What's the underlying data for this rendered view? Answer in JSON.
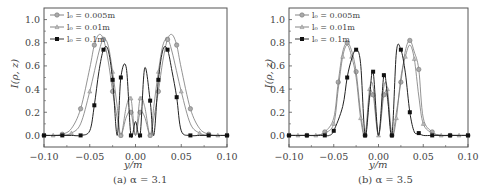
{
  "chart_data": [
    {
      "type": "line",
      "panel": "a",
      "title": "",
      "caption": "(a) α = 3.1",
      "xlabel": "y/m",
      "ylabel": "I(ρ, z)",
      "xlim": [
        -0.1,
        0.1
      ],
      "ylim": [
        -0.1,
        1.1
      ],
      "xticks": [
        "−0.10",
        "−0.05",
        "0.00",
        "0.05",
        "0.10"
      ],
      "yticks": [
        "0.0",
        "0.2",
        "0.4",
        "0.6",
        "0.8",
        "1.0"
      ],
      "grid": false,
      "legend_position": "upper left",
      "series": [
        {
          "name": "l0 = 0.005m",
          "marker": "circle",
          "color": "#888888",
          "x": [
            -0.1,
            -0.09,
            -0.08,
            -0.07,
            -0.06,
            -0.05,
            -0.045,
            -0.04,
            -0.035,
            -0.03,
            -0.025,
            -0.02,
            -0.016,
            -0.01,
            -0.005,
            0.0,
            0.005,
            0.01,
            0.016,
            0.02,
            0.025,
            0.03,
            0.035,
            0.04,
            0.045,
            0.05,
            0.06,
            0.07,
            0.08,
            0.09,
            0.1
          ],
          "values": [
            0.0,
            0.0,
            0.01,
            0.06,
            0.23,
            0.58,
            0.78,
            0.87,
            0.83,
            0.65,
            0.38,
            0.15,
            0.0,
            0.16,
            0.2,
            0.0,
            0.2,
            0.16,
            0.0,
            0.15,
            0.38,
            0.65,
            0.83,
            0.87,
            0.78,
            0.58,
            0.23,
            0.06,
            0.01,
            0.0,
            0.0
          ]
        },
        {
          "name": "l0 = 0.01m",
          "marker": "triangle",
          "color": "#999999",
          "x": [
            -0.1,
            -0.09,
            -0.08,
            -0.07,
            -0.06,
            -0.05,
            -0.04,
            -0.035,
            -0.03,
            -0.025,
            -0.02,
            -0.016,
            -0.01,
            -0.005,
            0.0,
            0.005,
            0.01,
            0.016,
            0.02,
            0.025,
            0.03,
            0.035,
            0.04,
            0.05,
            0.06,
            0.07,
            0.08,
            0.09,
            0.1
          ],
          "values": [
            0.0,
            0.0,
            0.0,
            0.02,
            0.1,
            0.38,
            0.72,
            0.83,
            0.78,
            0.55,
            0.25,
            0.0,
            0.25,
            0.32,
            0.0,
            0.32,
            0.25,
            0.0,
            0.25,
            0.55,
            0.78,
            0.83,
            0.72,
            0.38,
            0.1,
            0.02,
            0.0,
            0.0,
            0.0
          ]
        },
        {
          "name": "l0 = 0.1m",
          "marker": "square",
          "color": "#111111",
          "x": [
            -0.1,
            -0.09,
            -0.08,
            -0.07,
            -0.06,
            -0.05,
            -0.045,
            -0.04,
            -0.035,
            -0.03,
            -0.025,
            -0.02,
            -0.016,
            -0.01,
            -0.005,
            0.0,
            0.005,
            0.01,
            0.016,
            0.02,
            0.025,
            0.03,
            0.035,
            0.04,
            0.045,
            0.05,
            0.06,
            0.07,
            0.08,
            0.09,
            0.1
          ],
          "values": [
            0.0,
            0.0,
            0.0,
            0.0,
            0.0,
            0.04,
            0.26,
            0.55,
            0.74,
            0.74,
            0.48,
            0.0,
            0.5,
            0.58,
            0.0,
            0.12,
            0.0,
            0.58,
            0.3,
            0.0,
            0.48,
            0.74,
            0.74,
            0.55,
            0.33,
            0.04,
            0.0,
            0.0,
            0.0,
            0.0,
            0.0
          ]
        }
      ]
    },
    {
      "type": "line",
      "panel": "b",
      "title": "",
      "caption": "(b) α = 3.5",
      "xlabel": "y/m",
      "ylabel": "I(ρ, z)",
      "xlim": [
        -0.1,
        0.1
      ],
      "ylim": [
        -0.1,
        1.1
      ],
      "xticks": [
        "−0.10",
        "−0.05",
        "0.00",
        "0.05",
        "0.10"
      ],
      "yticks": [
        "0.0",
        "0.2",
        "0.4",
        "0.6",
        "0.8",
        "1.0"
      ],
      "grid": false,
      "legend_position": "upper left",
      "series": [
        {
          "name": "l0 = 0.005m",
          "marker": "circle",
          "color": "#888888",
          "x": [
            -0.1,
            -0.09,
            -0.08,
            -0.07,
            -0.06,
            -0.05,
            -0.045,
            -0.04,
            -0.035,
            -0.03,
            -0.025,
            -0.02,
            -0.015,
            -0.01,
            -0.006,
            0.0,
            0.006,
            0.01,
            0.015,
            0.02,
            0.025,
            0.03,
            0.035,
            0.04,
            0.045,
            0.05,
            0.06,
            0.07,
            0.08,
            0.09,
            0.1
          ],
          "values": [
            0.0,
            0.0,
            0.0,
            0.0,
            0.03,
            0.15,
            0.46,
            0.72,
            0.8,
            0.73,
            0.55,
            0.2,
            0.0,
            0.32,
            0.35,
            0.0,
            0.35,
            0.32,
            0.0,
            0.2,
            0.46,
            0.73,
            0.82,
            0.72,
            0.57,
            0.15,
            0.03,
            0.0,
            0.0,
            0.0,
            0.0
          ]
        },
        {
          "name": "l0 = 0.01m",
          "marker": "triangle",
          "color": "#999999",
          "x": [
            -0.1,
            -0.09,
            -0.08,
            -0.07,
            -0.06,
            -0.05,
            -0.045,
            -0.04,
            -0.035,
            -0.03,
            -0.025,
            -0.02,
            -0.015,
            -0.01,
            -0.006,
            0.0,
            0.006,
            0.01,
            0.015,
            0.02,
            0.025,
            0.03,
            0.035,
            0.04,
            0.045,
            0.05,
            0.06,
            0.07,
            0.08,
            0.09,
            0.1
          ],
          "values": [
            0.0,
            0.0,
            0.0,
            0.0,
            0.02,
            0.1,
            0.4,
            0.68,
            0.78,
            0.68,
            0.5,
            0.15,
            0.0,
            0.4,
            0.42,
            0.0,
            0.42,
            0.4,
            0.0,
            0.15,
            0.5,
            0.68,
            0.78,
            0.66,
            0.34,
            0.1,
            0.02,
            0.0,
            0.0,
            0.0,
            0.0
          ]
        },
        {
          "name": "l0 = 0.1m",
          "marker": "square",
          "color": "#111111",
          "x": [
            -0.1,
            -0.09,
            -0.08,
            -0.07,
            -0.06,
            -0.055,
            -0.05,
            -0.04,
            -0.035,
            -0.03,
            -0.025,
            -0.02,
            -0.015,
            -0.01,
            -0.006,
            0.0,
            0.006,
            0.01,
            0.015,
            0.02,
            0.025,
            0.03,
            0.035,
            0.04,
            0.045,
            0.05,
            0.06,
            0.07,
            0.08,
            0.09,
            0.1
          ],
          "values": [
            0.0,
            0.0,
            0.0,
            0.0,
            0.0,
            0.0,
            0.04,
            0.25,
            0.5,
            0.66,
            0.74,
            0.62,
            0.0,
            0.33,
            0.55,
            0.0,
            0.52,
            0.34,
            0.0,
            0.72,
            0.74,
            0.54,
            0.2,
            0.03,
            0.02,
            0.0,
            0.0,
            0.0,
            0.0,
            0.0,
            0.0
          ]
        }
      ]
    }
  ],
  "panels": {
    "a": {
      "caption": "(a) α = 3.1",
      "xlabel": "y/m",
      "ylabel": "I(ρ, z)",
      "legend": [
        "l₀ = 0.005m",
        "l₀ = 0.01m",
        "l₀ = 0.1m"
      ]
    },
    "b": {
      "caption": "(b) α = 3.5",
      "xlabel": "y/m",
      "ylabel": "I(ρ, z)",
      "legend": [
        "l₀ = 0.005m",
        "l₀ = 0.01m",
        "l₀ = 0.1m"
      ]
    }
  }
}
